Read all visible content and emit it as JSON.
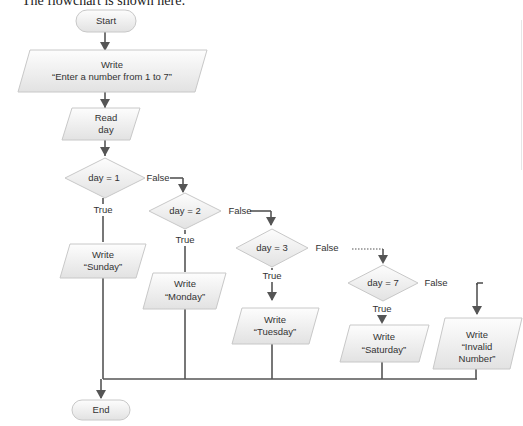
{
  "caption": "The flowchart is shown here:",
  "nodes": {
    "start": {
      "type": "terminator",
      "label": "Start"
    },
    "write_prompt": {
      "type": "io",
      "line1": "Write",
      "line2": "“Enter a number from 1 to 7”"
    },
    "read_day": {
      "type": "io",
      "line1": "Read",
      "line2": "day"
    },
    "dec1": {
      "type": "decision",
      "label": "day = 1"
    },
    "dec2": {
      "type": "decision",
      "label": "day = 2"
    },
    "dec3": {
      "type": "decision",
      "label": "day = 3"
    },
    "dec7": {
      "type": "decision",
      "label": "day = 7"
    },
    "w_sun": {
      "type": "io",
      "line1": "Write",
      "line2": "“Sunday”"
    },
    "w_mon": {
      "type": "io",
      "line1": "Write",
      "line2": "“Monday”"
    },
    "w_tue": {
      "type": "io",
      "line1": "Write",
      "line2": "“Tuesday”"
    },
    "w_sat": {
      "type": "io",
      "line1": "Write",
      "line2": "“Saturday”"
    },
    "w_inv": {
      "type": "io",
      "line1": "Write",
      "line2": "“Invalid",
      "line3": "Number”"
    },
    "end": {
      "type": "terminator",
      "label": "End"
    }
  },
  "edge_labels": {
    "true": "True",
    "false": "False"
  },
  "colors": {
    "shape_fill_top": "#fbfbfb",
    "shape_fill_bottom": "#e4e4e4",
    "shape_stroke": "#c8c8c8",
    "connector": "#555555",
    "text": "#333333"
  }
}
